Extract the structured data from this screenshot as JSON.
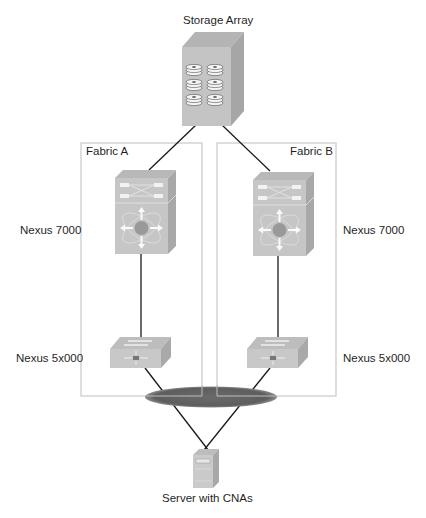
{
  "title": "Storage Array",
  "fabrics": [
    {
      "label": "Fabric A"
    },
    {
      "label": "Fabric B"
    }
  ],
  "devices": {
    "storage": {
      "label": "Storage Array",
      "icon": "storage-array-icon"
    },
    "nexus7000_a": {
      "label": "Nexus 7000",
      "icon": "nexus-7000-switch-icon"
    },
    "nexus7000_b": {
      "label": "Nexus 7000",
      "icon": "nexus-7000-switch-icon"
    },
    "nexus5000_a": {
      "label": "Nexus 5x000",
      "icon": "nexus-5000-switch-icon"
    },
    "nexus5000_b": {
      "label": "Nexus 5x000",
      "icon": "nexus-5000-switch-icon"
    },
    "server": {
      "label": "Server with CNAs",
      "icon": "server-icon"
    }
  },
  "colors": {
    "device_face": "#c8c8c8",
    "device_top": "#b4b4b4",
    "device_side": "#a6a6a6",
    "fabric_border": "#c9c9c9",
    "ellipse": "#666666",
    "link": "#1a1a1a"
  }
}
